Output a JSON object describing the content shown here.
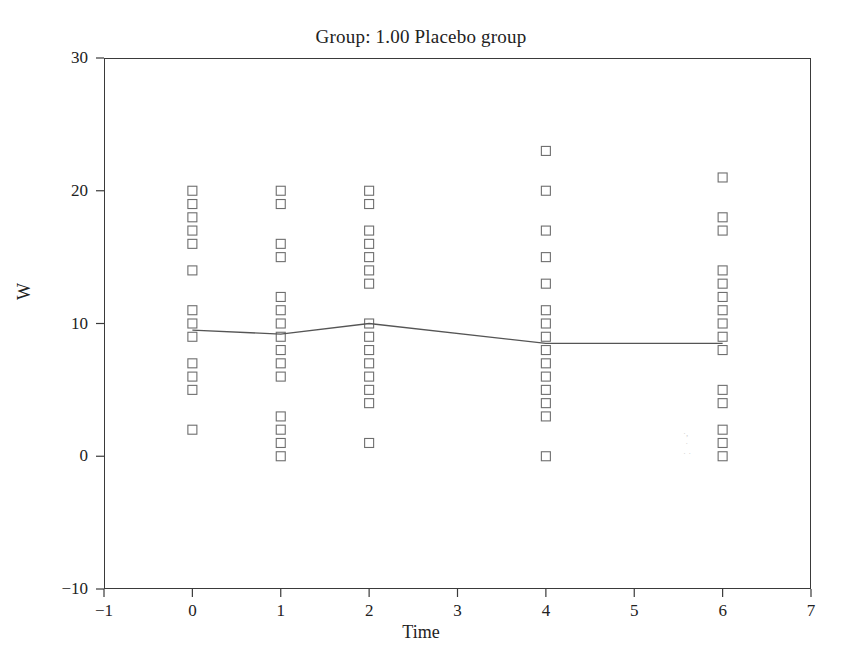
{
  "chart_data": {
    "type": "scatter",
    "title": "Group: 1.00 Placebo group",
    "xlabel": "Time",
    "ylabel": "W",
    "xlim": [
      -1,
      7
    ],
    "ylim": [
      -10,
      30
    ],
    "xticks": [
      "-1",
      "0",
      "1",
      "2",
      "3",
      "4",
      "5",
      "6",
      "7"
    ],
    "xtick_values": [
      -1,
      0,
      1,
      2,
      3,
      4,
      5,
      6,
      7
    ],
    "yticks": [
      "-10",
      "0",
      "10",
      "20",
      "30"
    ],
    "ytick_values": [
      -10,
      0,
      10,
      20,
      30
    ],
    "grid": false,
    "legend": null,
    "marker": "open-square",
    "marker_color": "#6e6e6e",
    "line_color": "#555555",
    "series": [
      {
        "name": "W observations",
        "type": "scatter",
        "points": [
          {
            "x": 0,
            "y": 20
          },
          {
            "x": 0,
            "y": 19
          },
          {
            "x": 0,
            "y": 18
          },
          {
            "x": 0,
            "y": 17
          },
          {
            "x": 0,
            "y": 16
          },
          {
            "x": 0,
            "y": 14
          },
          {
            "x": 0,
            "y": 11
          },
          {
            "x": 0,
            "y": 10
          },
          {
            "x": 0,
            "y": 9
          },
          {
            "x": 0,
            "y": 7
          },
          {
            "x": 0,
            "y": 6
          },
          {
            "x": 0,
            "y": 5
          },
          {
            "x": 0,
            "y": 2
          },
          {
            "x": 1,
            "y": 20
          },
          {
            "x": 1,
            "y": 19
          },
          {
            "x": 1,
            "y": 16
          },
          {
            "x": 1,
            "y": 15
          },
          {
            "x": 1,
            "y": 12
          },
          {
            "x": 1,
            "y": 11
          },
          {
            "x": 1,
            "y": 10
          },
          {
            "x": 1,
            "y": 9
          },
          {
            "x": 1,
            "y": 8
          },
          {
            "x": 1,
            "y": 7
          },
          {
            "x": 1,
            "y": 6
          },
          {
            "x": 1,
            "y": 3
          },
          {
            "x": 1,
            "y": 2
          },
          {
            "x": 1,
            "y": 1
          },
          {
            "x": 1,
            "y": 0
          },
          {
            "x": 2,
            "y": 20
          },
          {
            "x": 2,
            "y": 19
          },
          {
            "x": 2,
            "y": 17
          },
          {
            "x": 2,
            "y": 16
          },
          {
            "x": 2,
            "y": 15
          },
          {
            "x": 2,
            "y": 14
          },
          {
            "x": 2,
            "y": 13
          },
          {
            "x": 2,
            "y": 10
          },
          {
            "x": 2,
            "y": 9
          },
          {
            "x": 2,
            "y": 8
          },
          {
            "x": 2,
            "y": 7
          },
          {
            "x": 2,
            "y": 6
          },
          {
            "x": 2,
            "y": 5
          },
          {
            "x": 2,
            "y": 4
          },
          {
            "x": 2,
            "y": 1
          },
          {
            "x": 4,
            "y": 23
          },
          {
            "x": 4,
            "y": 20
          },
          {
            "x": 4,
            "y": 17
          },
          {
            "x": 4,
            "y": 15
          },
          {
            "x": 4,
            "y": 13
          },
          {
            "x": 4,
            "y": 11
          },
          {
            "x": 4,
            "y": 10
          },
          {
            "x": 4,
            "y": 9
          },
          {
            "x": 4,
            "y": 8
          },
          {
            "x": 4,
            "y": 7
          },
          {
            "x": 4,
            "y": 6
          },
          {
            "x": 4,
            "y": 5
          },
          {
            "x": 4,
            "y": 4
          },
          {
            "x": 4,
            "y": 3
          },
          {
            "x": 4,
            "y": 0
          },
          {
            "x": 6,
            "y": 21
          },
          {
            "x": 6,
            "y": 18
          },
          {
            "x": 6,
            "y": 17
          },
          {
            "x": 6,
            "y": 14
          },
          {
            "x": 6,
            "y": 13
          },
          {
            "x": 6,
            "y": 12
          },
          {
            "x": 6,
            "y": 11
          },
          {
            "x": 6,
            "y": 10
          },
          {
            "x": 6,
            "y": 9
          },
          {
            "x": 6,
            "y": 8
          },
          {
            "x": 6,
            "y": 5
          },
          {
            "x": 6,
            "y": 4
          },
          {
            "x": 6,
            "y": 2
          },
          {
            "x": 6,
            "y": 1
          },
          {
            "x": 6,
            "y": 0
          }
        ]
      },
      {
        "name": "mean trend line",
        "type": "line",
        "x": [
          0,
          1,
          2,
          4,
          6
        ],
        "values": [
          9.5,
          9.2,
          10.0,
          8.5,
          8.5
        ]
      }
    ]
  }
}
